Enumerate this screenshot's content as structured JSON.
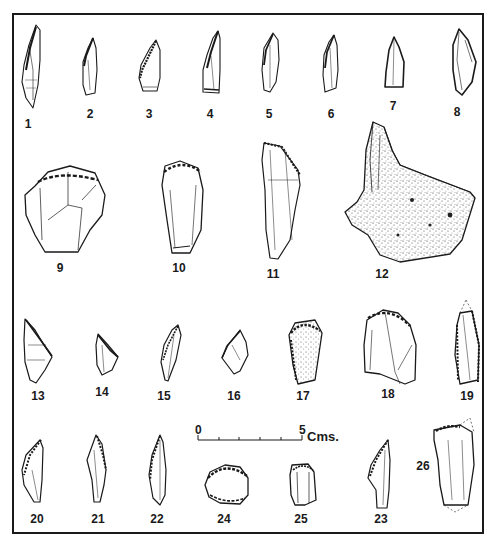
{
  "figure": {
    "frame_color": "#1a1a1a",
    "artifacts": [
      {
        "id": "1",
        "label": "1",
        "x": 28,
        "y": 118
      },
      {
        "id": "2",
        "label": "2",
        "x": 90,
        "y": 117
      },
      {
        "id": "3",
        "label": "3",
        "x": 149,
        "y": 117
      },
      {
        "id": "4",
        "label": "4",
        "x": 210,
        "y": 117
      },
      {
        "id": "5",
        "label": "5",
        "x": 269,
        "y": 117
      },
      {
        "id": "6",
        "label": "6",
        "x": 331,
        "y": 117
      },
      {
        "id": "7",
        "label": "7",
        "x": 393,
        "y": 108
      },
      {
        "id": "8",
        "label": "8",
        "x": 457,
        "y": 113
      },
      {
        "id": "9",
        "label": "9",
        "x": 60,
        "y": 268
      },
      {
        "id": "10",
        "label": "10",
        "x": 179,
        "y": 268
      },
      {
        "id": "11",
        "label": "11",
        "x": 273,
        "y": 274
      },
      {
        "id": "12",
        "label": "12",
        "x": 382,
        "y": 274
      },
      {
        "id": "13",
        "label": "13",
        "x": 38,
        "y": 396
      },
      {
        "id": "14",
        "label": "14",
        "x": 102,
        "y": 391
      },
      {
        "id": "15",
        "label": "15",
        "x": 164,
        "y": 396
      },
      {
        "id": "16",
        "label": "16",
        "x": 234,
        "y": 396
      },
      {
        "id": "17",
        "label": "17",
        "x": 303,
        "y": 396
      },
      {
        "id": "18",
        "label": "18",
        "x": 388,
        "y": 394
      },
      {
        "id": "19",
        "label": "19",
        "x": 467,
        "y": 396
      },
      {
        "id": "20",
        "label": "20",
        "x": 37,
        "y": 516
      },
      {
        "id": "21",
        "label": "21",
        "x": 98,
        "y": 516
      },
      {
        "id": "22",
        "label": "22",
        "x": 157,
        "y": 516
      },
      {
        "id": "24",
        "label": "24",
        "x": 224,
        "y": 516
      },
      {
        "id": "25",
        "label": "25",
        "x": 301,
        "y": 516
      },
      {
        "id": "23",
        "label": "23",
        "x": 381,
        "y": 516
      },
      {
        "id": "26",
        "label": "26",
        "x": 422,
        "y": 466
      }
    ],
    "scale_bar": {
      "start_label": "0",
      "end_label": "5",
      "unit_label": "Cms.",
      "ticks": 5
    }
  }
}
